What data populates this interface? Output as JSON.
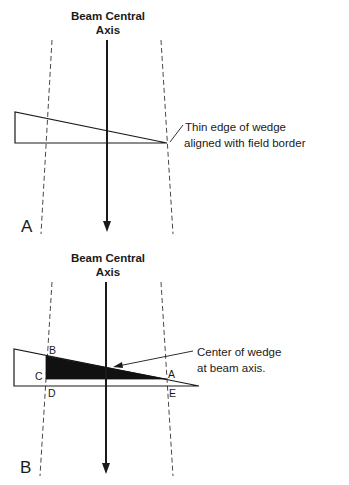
{
  "panels": [
    {
      "id": "A",
      "panel_label": "A",
      "axis_label_line1": "Beam Central",
      "axis_label_line2": "Axis",
      "annotation_line1": "Thin edge of wedge",
      "annotation_line2": "aligned with field border"
    },
    {
      "id": "B",
      "panel_label": "B",
      "axis_label_line1": "Beam Central",
      "axis_label_line2": "Axis",
      "annotation_line1": "Center of wedge",
      "annotation_line2": "at beam axis.",
      "points": {
        "B": "B",
        "C": "C",
        "A": "A",
        "D": "D",
        "E": "E"
      }
    }
  ],
  "colors": {
    "ink": "#1a1a1a",
    "background": "#ffffff"
  }
}
